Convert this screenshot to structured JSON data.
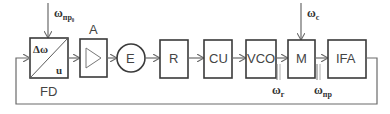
{
  "diagram": {
    "blocks": [
      {
        "id": "FD",
        "label": "FD",
        "inner_top_label": "Δω",
        "inner_bottom_label": "u"
      },
      {
        "id": "A",
        "label": "A"
      },
      {
        "id": "E",
        "label": "E"
      },
      {
        "id": "R",
        "label": "R"
      },
      {
        "id": "CU",
        "label": "CU"
      },
      {
        "id": "VCO",
        "label": "VCO"
      },
      {
        "id": "M",
        "label": "M"
      },
      {
        "id": "IFA",
        "label": "IFA"
      }
    ],
    "signals": {
      "fd_input": {
        "main": "ω",
        "sub": "пр₀"
      },
      "m_input": {
        "main": "ω",
        "sub": "c"
      },
      "vco_output": {
        "main": "ω",
        "sub": "г"
      },
      "m_output": {
        "main": "ω",
        "sub": "пр"
      }
    },
    "connections": [
      "FD→A",
      "A→E",
      "E→R",
      "R→CU",
      "CU→VCO",
      "VCO→M",
      "M→IFA",
      "IFA→FD (feedback)"
    ]
  },
  "colors": {
    "stroke": "#3a3a3a",
    "line": "#6a6a6a",
    "text": "#444444"
  }
}
